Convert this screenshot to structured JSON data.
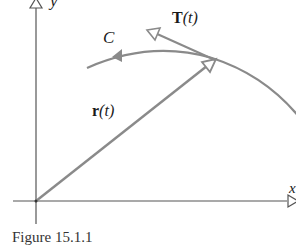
{
  "figure": {
    "caption": "Figure 15.1.1",
    "labels": {
      "y_axis": "y",
      "x_axis": "x",
      "curve": "C",
      "tangent_vector_bold": "T",
      "tangent_vector_arg": "(t)",
      "position_vector_bold": "r",
      "position_vector_arg": "(t)"
    },
    "colors": {
      "axes": "#555555",
      "curve": "#8a8a8a",
      "vector": "#8a8a8a",
      "text": "#1a1a1a"
    }
  }
}
